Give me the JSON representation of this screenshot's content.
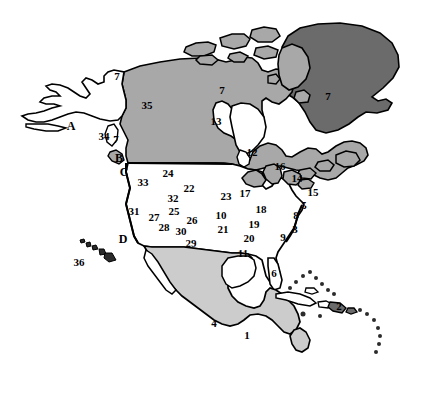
{
  "figure": {
    "width": 425,
    "height": 416,
    "background_color": "#ffffff"
  },
  "legend_colors": {
    "greenland_fill": "#6b6b6b",
    "canada_fill": "#a8a8a8",
    "united_states_fill": "#ffffff",
    "mexico_central_america_fill": "#cccccc",
    "island_fill": "#6b6b6b",
    "outline": "#000000",
    "label_color": "#000000"
  },
  "regions": {
    "greenland": {
      "name": "Greenland",
      "shade": "dark-gray"
    },
    "canada": {
      "name": "Canada",
      "shade": "medium-gray"
    },
    "united_states": {
      "name": "United States",
      "shade": "white"
    },
    "mexico_central_america": {
      "name": "Mexico and Central America",
      "shade": "light-gray"
    }
  },
  "labels": [
    {
      "text": "7",
      "x": 117,
      "y": 76,
      "kind": "number",
      "area": "alaska-yukon-border"
    },
    {
      "text": "A",
      "x": 71,
      "y": 126,
      "kind": "letter",
      "area": "southern-alaska"
    },
    {
      "text": "35",
      "x": 147,
      "y": 105,
      "kind": "number",
      "area": "western-canada"
    },
    {
      "text": "7",
      "x": 222,
      "y": 90,
      "kind": "number",
      "area": "northern-canada"
    },
    {
      "text": "13",
      "x": 216,
      "y": 121,
      "kind": "number",
      "area": "central-canada"
    },
    {
      "text": "7",
      "x": 328,
      "y": 96,
      "kind": "number",
      "area": "baffin-greenland"
    },
    {
      "text": "12",
      "x": 252,
      "y": 152,
      "kind": "number",
      "area": "eastern-canada"
    },
    {
      "text": "34",
      "x": 104,
      "y": 136,
      "kind": "number",
      "area": "vancouver-island"
    },
    {
      "text": "7",
      "x": 116,
      "y": 139,
      "kind": "number",
      "area": "british-columbia-coast"
    },
    {
      "text": "B",
      "x": 119,
      "y": 158,
      "kind": "letter",
      "area": "puget-sound"
    },
    {
      "text": "C",
      "x": 124,
      "y": 172,
      "kind": "letter",
      "area": "oregon-coast"
    },
    {
      "text": "33",
      "x": 143,
      "y": 182,
      "kind": "number",
      "area": "northwest-interior"
    },
    {
      "text": "24",
      "x": 168,
      "y": 173,
      "kind": "number",
      "area": "northern-plains"
    },
    {
      "text": "22",
      "x": 189,
      "y": 188,
      "kind": "number",
      "area": "central-plains"
    },
    {
      "text": "32",
      "x": 173,
      "y": 198,
      "kind": "number",
      "area": "great-basin-north"
    },
    {
      "text": "25",
      "x": 174,
      "y": 211,
      "kind": "number",
      "area": "great-basin-south"
    },
    {
      "text": "31",
      "x": 134,
      "y": 211,
      "kind": "number",
      "area": "northern-california"
    },
    {
      "text": "27",
      "x": 154,
      "y": 217,
      "kind": "number",
      "area": "southwest-interior"
    },
    {
      "text": "26",
      "x": 192,
      "y": 220,
      "kind": "number",
      "area": "central-rockies"
    },
    {
      "text": "28",
      "x": 164,
      "y": 227,
      "kind": "number",
      "area": "southwest"
    },
    {
      "text": "30",
      "x": 181,
      "y": 231,
      "kind": "number",
      "area": "southern-rockies"
    },
    {
      "text": "29",
      "x": 191,
      "y": 243,
      "kind": "number",
      "area": "southern-plains"
    },
    {
      "text": "D",
      "x": 123,
      "y": 239,
      "kind": "letter",
      "area": "southern-california-coast"
    },
    {
      "text": "36",
      "x": 79,
      "y": 262,
      "kind": "number",
      "area": "hawaii"
    },
    {
      "text": "23",
      "x": 226,
      "y": 196,
      "kind": "number",
      "area": "upper-midwest"
    },
    {
      "text": "17",
      "x": 245,
      "y": 193,
      "kind": "number",
      "area": "great-lakes-west"
    },
    {
      "text": "10",
      "x": 221,
      "y": 215,
      "kind": "number",
      "area": "midwest"
    },
    {
      "text": "18",
      "x": 261,
      "y": 209,
      "kind": "number",
      "area": "ohio-valley"
    },
    {
      "text": "19",
      "x": 254,
      "y": 224,
      "kind": "number",
      "area": "mid-south"
    },
    {
      "text": "21",
      "x": 223,
      "y": 229,
      "kind": "number",
      "area": "lower-midwest"
    },
    {
      "text": "20",
      "x": 249,
      "y": 238,
      "kind": "number",
      "area": "deep-south"
    },
    {
      "text": "11",
      "x": 243,
      "y": 253,
      "kind": "number",
      "area": "gulf-coast"
    },
    {
      "text": "16",
      "x": 280,
      "y": 166,
      "kind": "number",
      "area": "lake-huron"
    },
    {
      "text": "14",
      "x": 297,
      "y": 178,
      "kind": "number",
      "area": "lake-ontario"
    },
    {
      "text": "15",
      "x": 313,
      "y": 192,
      "kind": "number",
      "area": "new-england"
    },
    {
      "text": "5",
      "x": 304,
      "y": 205,
      "kind": "number",
      "area": "mid-atlantic-north"
    },
    {
      "text": "8",
      "x": 296,
      "y": 215,
      "kind": "number",
      "area": "mid-atlantic"
    },
    {
      "text": "3",
      "x": 295,
      "y": 229,
      "kind": "number",
      "area": "southeast-coast"
    },
    {
      "text": "9",
      "x": 283,
      "y": 237,
      "kind": "number",
      "area": "southeast"
    },
    {
      "text": "6",
      "x": 274,
      "y": 273,
      "kind": "number",
      "area": "florida"
    },
    {
      "text": "4",
      "x": 214,
      "y": 323,
      "kind": "number",
      "area": "mexico"
    },
    {
      "text": "1",
      "x": 247,
      "y": 335,
      "kind": "number",
      "area": "central-america"
    },
    {
      "text": "2",
      "x": 339,
      "y": 306,
      "kind": "number",
      "area": "hispaniola"
    }
  ]
}
